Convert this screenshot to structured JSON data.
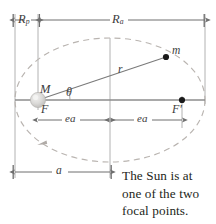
{
  "figure": {
    "background_color": "#ffffff"
  },
  "labels": {
    "perihelion": {
      "base": "R",
      "sub": "p",
      "text": "Rp"
    },
    "aphelion": {
      "base": "R",
      "sub": "a",
      "text": "Ra"
    },
    "central_mass": "M",
    "focus_left": "F",
    "focus_right": "F'",
    "orbiting_mass": "m",
    "radius": "r",
    "angle": "θ",
    "focal_distance_left": "ea",
    "focal_distance_right": "ea",
    "semi_major_axis": "a"
  },
  "caption": {
    "line1": "The Sun is at",
    "line2": "one of the two",
    "line3": "focal points."
  },
  "colors": {
    "orbit_dashed": "#b9b4b0",
    "axis_line": "#8d8d8d",
    "dimension_line": "#6e6e6e",
    "construction_line": "#a9a9a9",
    "label_text": "#3b3b3b",
    "caption_text": "#231f20",
    "sun_body": "#d0cfcd",
    "planet_dot": "#1a1a1a"
  },
  "geometry": {
    "ellipse_center_x": 110,
    "ellipse_center_y": 100,
    "semi_major_px": 95,
    "semi_minor_px": 62,
    "focus_left_x": 38,
    "focus_right_x": 182,
    "major_axis_y": 100,
    "planet_x": 166,
    "planet_y": 57,
    "angle_theta_deg": 17,
    "top_dim_y": 20,
    "bottom_dim_y": 172,
    "mid_dim_y": 120
  }
}
